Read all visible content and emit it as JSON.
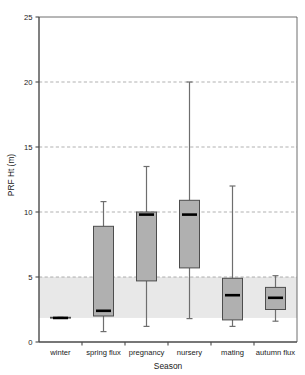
{
  "chart_data": {
    "type": "box",
    "title": "",
    "xlabel": "Season",
    "ylabel": "PRF Ht (m)",
    "categories": [
      "winter",
      "spring flux",
      "pregnancy",
      "nursery",
      "mating",
      "autumn flux"
    ],
    "ylim": [
      0,
      25
    ],
    "yticks": [
      0,
      5,
      10,
      15,
      20,
      25
    ],
    "ytick_labels": [
      "0",
      "5",
      "10",
      "15",
      "20",
      "25"
    ],
    "grid": "horizontal dashed gridlines at 5, 10, 15, 20",
    "legend": "none",
    "annotations": "grey shaded horizontal band spanning roughly 1.85 to 5 m across full plot width",
    "shaded_band": {
      "low": 1.85,
      "high": 5.0
    },
    "box_fill_color": "#b0b0b0",
    "box_edge_color": "#4d4d4d",
    "median_color": "#000000",
    "band_color": "#e8e8e8",
    "boxes": [
      {
        "category": "winter",
        "whisker_low": 1.85,
        "q1": 1.85,
        "median": 1.85,
        "q3": 1.9,
        "whisker_high": 1.9
      },
      {
        "category": "spring flux",
        "whisker_low": 0.8,
        "q1": 2.0,
        "median": 2.4,
        "q3": 8.9,
        "whisker_high": 10.8
      },
      {
        "category": "pregnancy",
        "whisker_low": 1.2,
        "q1": 4.7,
        "median": 9.8,
        "q3": 10.0,
        "whisker_high": 13.5
      },
      {
        "category": "nursery",
        "whisker_low": 1.8,
        "q1": 5.7,
        "median": 9.8,
        "q3": 10.9,
        "whisker_high": 20.0
      },
      {
        "category": "mating",
        "whisker_low": 1.2,
        "q1": 1.7,
        "median": 3.6,
        "q3": 4.9,
        "whisker_high": 12.0
      },
      {
        "category": "autumn flux",
        "whisker_low": 1.6,
        "q1": 2.5,
        "median": 3.4,
        "q3": 4.2,
        "whisker_high": 5.1
      }
    ]
  }
}
